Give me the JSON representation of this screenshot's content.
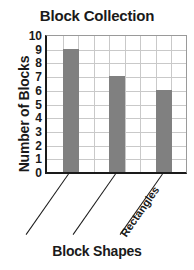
{
  "chart_data": {
    "type": "bar",
    "title": "Block Collection",
    "xlabel": "Block Shapes",
    "ylabel": "Number of Blocks",
    "categories": [
      "",
      "Rectangles",
      ""
    ],
    "values": [
      9,
      7,
      6
    ],
    "ylim": [
      0,
      10
    ],
    "ytick_labels": [
      "0",
      "1",
      "2",
      "3",
      "4",
      "5",
      "6",
      "7",
      "8",
      "9",
      "10"
    ],
    "grid": true,
    "legend": "none",
    "bar_color": "#808080",
    "axis_color": "#1a1a1a",
    "grid_color": "#c9c9c9"
  }
}
